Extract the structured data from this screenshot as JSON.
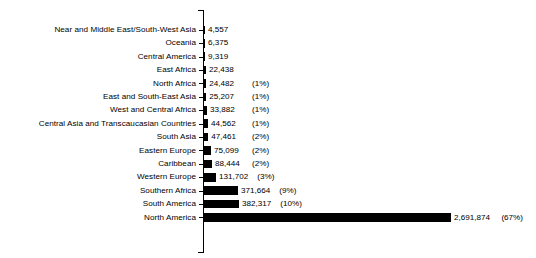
{
  "chart_data": {
    "type": "bar",
    "orientation": "horizontal",
    "title": "",
    "xlabel": "",
    "ylabel": "",
    "grid": false,
    "legend": null,
    "xlim": [
      0,
      2691874
    ],
    "categories": [
      "Near and Middle East/South-West Asia",
      "Oceania",
      "Central America",
      "East Africa",
      "North Africa",
      "East and South-East Asia",
      "West and Central Africa",
      "Central Asia and Transcaucasian Countries",
      "South Asia",
      "Eastern Europe",
      "Caribbean",
      "Western Europe",
      "Southern Africa",
      "South America",
      "North America"
    ],
    "values": [
      4557,
      6375,
      9319,
      22438,
      24482,
      25207,
      33882,
      44562,
      47461,
      75099,
      88444,
      131702,
      371664,
      382317,
      2691874
    ],
    "value_labels": [
      "4,557",
      "6,375",
      "9,319",
      "22,438",
      "24,482",
      "25,207",
      "33,882",
      "44,562",
      "47,461",
      "75,099",
      "88,444",
      "131,702",
      "371,664",
      "382,317",
      "2,691,874"
    ],
    "percent_labels": [
      "",
      "",
      "",
      "",
      "(1%)",
      "(1%)",
      "(1%)",
      "(1%)",
      "(2%)",
      "(2%)",
      "(2%)",
      "(3%)",
      "(9%)",
      "(10%)",
      "(67%)"
    ],
    "bar_color": "#000000",
    "axis_color": "#000000"
  }
}
